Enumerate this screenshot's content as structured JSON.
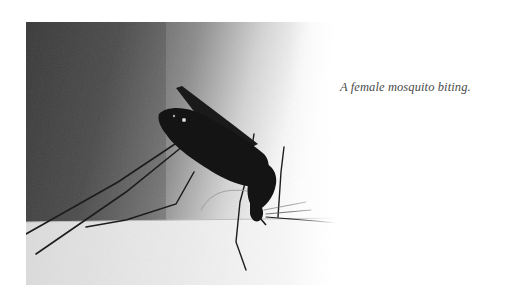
{
  "figure": {
    "caption": "A female mosquito biting.",
    "colors": {
      "background_dark": "#3a3a3a",
      "background_light": "#ffffff",
      "insect": "#141414",
      "skin": "#eaeaea",
      "caption_text": "#4a4a4a"
    }
  }
}
